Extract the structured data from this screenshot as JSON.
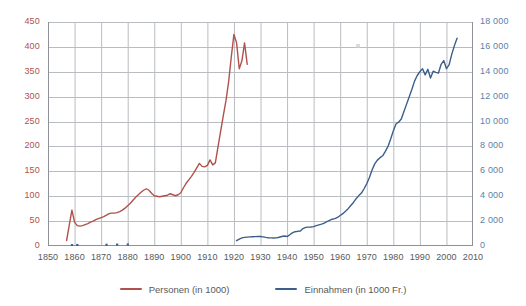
{
  "chart_data": {
    "type": "line",
    "title": "",
    "xlabel": "",
    "ylabel": "",
    "xlim": [
      1850,
      2010
    ],
    "xticks": [
      1850,
      1860,
      1870,
      1880,
      1890,
      1900,
      1910,
      1920,
      1930,
      1940,
      1950,
      1960,
      1970,
      1980,
      1990,
      2000,
      2010
    ],
    "grid": true,
    "legend_position": "bottom-center",
    "axes": [
      {
        "id": "left",
        "label": "Personen (in 1000)",
        "color": "#b1514b",
        "ylim": [
          0,
          450
        ],
        "yticks": [
          0,
          50,
          100,
          150,
          200,
          250,
          300,
          350,
          400,
          450
        ],
        "yticklabels": [
          "0",
          "50",
          "100",
          "150",
          "200",
          "250",
          "300",
          "350",
          "400",
          "450"
        ]
      },
      {
        "id": "right",
        "label": "Einnahmen (in 1000 Fr.)",
        "color": "#5c7fa8",
        "ylim": [
          0,
          18000
        ],
        "yticks": [
          0,
          2000,
          4000,
          6000,
          8000,
          10000,
          12000,
          14000,
          16000,
          18000
        ],
        "yticklabels": [
          "0",
          "2 000",
          "4 000",
          "6 000",
          "8 000",
          "10 000",
          "12 000",
          "14 000",
          "16 000",
          "18 000"
        ]
      }
    ],
    "series": [
      {
        "name": "Personen (in 1000)",
        "axis": "left",
        "color": "#b1514b",
        "unit": "1000 Personen",
        "x": [
          1857,
          1858,
          1859,
          1860,
          1861,
          1862,
          1863,
          1864,
          1865,
          1866,
          1867,
          1868,
          1869,
          1870,
          1871,
          1872,
          1873,
          1874,
          1875,
          1876,
          1877,
          1878,
          1879,
          1880,
          1881,
          1882,
          1883,
          1884,
          1885,
          1886,
          1887,
          1888,
          1889,
          1890,
          1891,
          1892,
          1893,
          1894,
          1895,
          1896,
          1897,
          1898,
          1899,
          1900,
          1901,
          1902,
          1903,
          1904,
          1905,
          1906,
          1907,
          1908,
          1909,
          1910,
          1911,
          1912,
          1913,
          1914,
          1915,
          1916,
          1917,
          1918,
          1919,
          1920,
          1921,
          1922,
          1923,
          1924,
          1925
        ],
        "y": [
          11,
          42,
          72,
          48,
          41,
          40,
          41,
          43,
          45,
          48,
          50,
          53,
          55,
          57,
          59,
          62,
          65,
          66,
          66,
          67,
          69,
          72,
          76,
          81,
          86,
          92,
          98,
          103,
          108,
          112,
          115,
          112,
          106,
          101,
          100,
          99,
          100,
          101,
          102,
          105,
          103,
          101,
          103,
          107,
          117,
          126,
          133,
          140,
          148,
          157,
          166,
          160,
          159,
          162,
          173,
          163,
          167,
          199,
          231,
          262,
          292,
          330,
          380,
          425,
          408,
          356,
          372,
          408,
          365
        ]
      },
      {
        "name": "Einnahmen (in 1000 Fr.)",
        "axis": "right",
        "color": "#3b5f8a",
        "unit": "1000 Fr.",
        "early_points": {
          "x": [
            1859,
            1861,
            1872,
            1876,
            1880
          ],
          "y": [
            60,
            70,
            90,
            100,
            110
          ],
          "note": "isolated dots near zero on the right axis"
        },
        "x": [
          1921,
          1922,
          1923,
          1924,
          1925,
          1926,
          1927,
          1928,
          1929,
          1930,
          1931,
          1932,
          1933,
          1934,
          1935,
          1936,
          1937,
          1938,
          1939,
          1940,
          1941,
          1942,
          1943,
          1944,
          1945,
          1946,
          1947,
          1948,
          1949,
          1950,
          1951,
          1952,
          1953,
          1954,
          1955,
          1956,
          1957,
          1958,
          1959,
          1960,
          1961,
          1962,
          1963,
          1964,
          1965,
          1966,
          1967,
          1968,
          1969,
          1970,
          1971,
          1972,
          1973,
          1974,
          1975,
          1976,
          1977,
          1978,
          1979,
          1980,
          1981,
          1982,
          1983,
          1984,
          1985,
          1986,
          1987,
          1988,
          1989,
          1990,
          1991,
          1992,
          1993,
          1994,
          1995,
          1996,
          1997,
          1998,
          1999,
          2000,
          2001,
          2002,
          2003,
          2004
        ],
        "y": [
          430,
          560,
          650,
          690,
          710,
          730,
          745,
          755,
          770,
          760,
          730,
          690,
          660,
          650,
          640,
          650,
          700,
          760,
          800,
          760,
          900,
          1050,
          1150,
          1180,
          1200,
          1400,
          1500,
          1520,
          1530,
          1560,
          1640,
          1700,
          1760,
          1840,
          1950,
          2050,
          2150,
          2200,
          2300,
          2450,
          2600,
          2800,
          3000,
          3250,
          3500,
          3800,
          4050,
          4250,
          4600,
          5000,
          5500,
          6100,
          6600,
          6900,
          7100,
          7250,
          7600,
          8000,
          8600,
          9250,
          9800,
          9950,
          10200,
          10800,
          11400,
          12000,
          12600,
          13250,
          13700,
          14000,
          14250,
          13750,
          14200,
          13500,
          14050,
          13950,
          13900,
          14600,
          14900,
          14250,
          14550,
          15400,
          16100,
          16700
        ]
      }
    ]
  },
  "legend": {
    "items": [
      {
        "label": "Personen (in 1000)",
        "color": "#b1514b"
      },
      {
        "label": "Einnahmen (in 1000 Fr.)",
        "color": "#3b5f8a"
      }
    ]
  },
  "colors": {
    "series_red": "#b1514b",
    "series_blue": "#3b5f8a",
    "left_axis_text": "#b1514b",
    "right_axis_text": "#5c7fa8",
    "x_axis_text": "#58595b",
    "grid": "#b9bcc0",
    "background": "#ffffff"
  }
}
